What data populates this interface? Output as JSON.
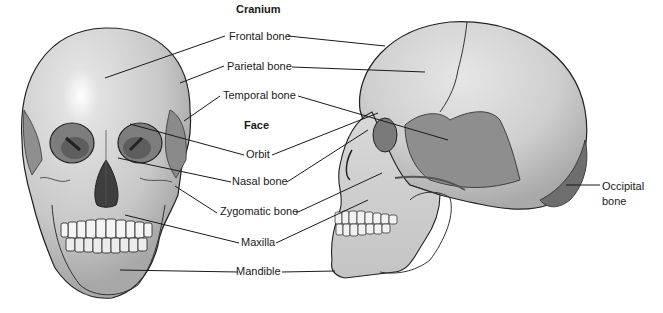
{
  "diagram": {
    "headings": {
      "cranium": "Cranium",
      "face": "Face"
    },
    "labels": {
      "frontal": "Frontal bone",
      "parietal": "Parietal bone",
      "temporal": "Temporal bone",
      "orbit": "Orbit",
      "nasal": "Nasal bone",
      "zygomatic": "Zygomatic bone",
      "maxilla": "Maxilla",
      "mandible": "Mandible",
      "occipital_line1": "Occipital",
      "occipital_line2": "bone"
    },
    "views": [
      "anterior-view-skull",
      "lateral-view-skull"
    ],
    "colors": {
      "bone_light": "#d6d6d6",
      "bone_mid": "#b4b4b4",
      "bone_dark": "#7a7a7a",
      "temporal_region": "#8c8c8c",
      "occipital_region": "#6e6e6e",
      "outline": "#222222",
      "leader_line": "#1a1a1a"
    }
  }
}
